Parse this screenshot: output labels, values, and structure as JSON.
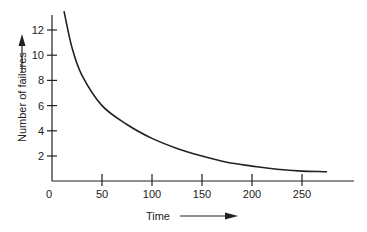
{
  "chart_data": {
    "type": "line",
    "title": "",
    "xlabel": "Time",
    "ylabel": "Number of failures",
    "x_ticks": [
      "0",
      "50",
      "100",
      "150",
      "200",
      "250"
    ],
    "y_ticks": [
      "2",
      "4",
      "6",
      "8",
      "10",
      "12"
    ],
    "xlim": [
      0,
      300
    ],
    "ylim": [
      0,
      13.5
    ],
    "grid": false,
    "legend": null,
    "series": [
      {
        "name": "failures",
        "x": [
          12,
          20,
          30,
          50,
          75,
          100,
          125,
          150,
          175,
          200,
          225,
          250,
          275
        ],
        "values": [
          13.5,
          10.6,
          8.4,
          6.0,
          4.5,
          3.4,
          2.6,
          2.0,
          1.5,
          1.2,
          0.95,
          0.8,
          0.75
        ]
      }
    ],
    "annotations": [
      "arrow pointing up next to y-axis label",
      "arrow pointing right next to x-axis label"
    ]
  },
  "axes": {
    "xlabel": "Time",
    "ylabel": "Number of failures",
    "origin_label": "0"
  }
}
